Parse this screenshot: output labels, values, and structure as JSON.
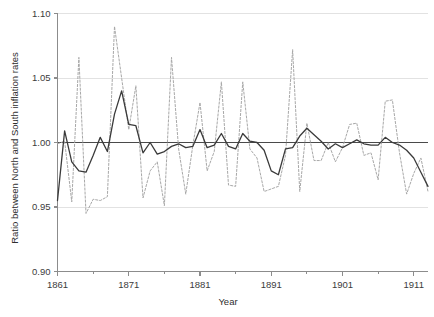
{
  "chart_data": {
    "type": "line",
    "title": "",
    "xlabel": "Year",
    "ylabel": "Ratio between North and South inflation rates",
    "xlim": [
      1861,
      1913
    ],
    "ylim": [
      0.9,
      1.1
    ],
    "grid": true,
    "grid_axis": "y",
    "legend": "none",
    "reference_line": 1.0,
    "xticks": [
      1861,
      1871,
      1881,
      1891,
      1901,
      1911
    ],
    "xticklabels": [
      "1861",
      "1871",
      "1881",
      "1891",
      "1901",
      "1911"
    ],
    "yticks": [
      0.9,
      0.95,
      1.0,
      1.05,
      1.1
    ],
    "yticklabels": [
      "0.90",
      "0.95",
      "1.00",
      "1.05",
      "1.10"
    ],
    "colors": {
      "smoothed": "#3a3a3a",
      "annual": "#a8a8a8",
      "reference": "#4a4a4a",
      "grid": "#e2e2e2",
      "axis": "#8c8c8c"
    },
    "series": [
      {
        "name": "annual ratio",
        "style": "dashed",
        "color": "#a8a8a8",
        "x": [
          1861,
          1862,
          1863,
          1864,
          1865,
          1866,
          1867,
          1868,
          1869,
          1870,
          1871,
          1872,
          1873,
          1874,
          1875,
          1876,
          1877,
          1878,
          1879,
          1880,
          1881,
          1882,
          1883,
          1884,
          1885,
          1886,
          1887,
          1888,
          1889,
          1890,
          1891,
          1892,
          1893,
          1894,
          1895,
          1896,
          1897,
          1898,
          1899,
          1900,
          1901,
          1902,
          1903,
          1904,
          1905,
          1906,
          1907,
          1908,
          1909,
          1910,
          1911,
          1912,
          1913
        ],
        "values": [
          0.999,
          1.001,
          0.954,
          1.066,
          0.945,
          0.956,
          0.955,
          0.958,
          1.09,
          1.05,
          1.01,
          1.044,
          0.957,
          0.978,
          0.985,
          0.951,
          1.066,
          0.995,
          0.96,
          0.998,
          1.031,
          0.978,
          0.993,
          1.047,
          0.967,
          0.966,
          1.047,
          0.995,
          0.988,
          0.962,
          0.964,
          0.966,
          0.99,
          1.072,
          0.962,
          1.015,
          0.986,
          0.986,
          1.0,
          0.985,
          0.996,
          1.014,
          1.015,
          0.99,
          0.992,
          0.971,
          1.032,
          1.033,
          0.992,
          0.96,
          0.976,
          0.988,
          0.962
        ]
      },
      {
        "name": "smoothed ratio",
        "style": "solid",
        "color": "#3a3a3a",
        "x": [
          1861,
          1862,
          1863,
          1864,
          1865,
          1866,
          1867,
          1868,
          1869,
          1870,
          1871,
          1872,
          1873,
          1874,
          1875,
          1876,
          1877,
          1878,
          1879,
          1880,
          1881,
          1882,
          1883,
          1884,
          1885,
          1886,
          1887,
          1888,
          1889,
          1890,
          1891,
          1892,
          1893,
          1894,
          1895,
          1896,
          1897,
          1898,
          1899,
          1900,
          1901,
          1902,
          1903,
          1904,
          1905,
          1906,
          1907,
          1908,
          1909,
          1910,
          1911,
          1912,
          1913
        ],
        "values": [
          0.955,
          1.009,
          0.985,
          0.978,
          0.977,
          0.99,
          1.004,
          0.993,
          1.022,
          1.04,
          1.014,
          1.013,
          0.992,
          1.0,
          0.991,
          0.993,
          0.997,
          0.999,
          0.996,
          0.997,
          1.01,
          0.996,
          0.998,
          1.007,
          0.997,
          0.995,
          1.007,
          1.001,
          1.0,
          0.994,
          0.978,
          0.975,
          0.995,
          0.996,
          1.005,
          1.011,
          1.006,
          1.001,
          0.995,
          0.999,
          0.996,
          0.999,
          1.002,
          0.999,
          0.998,
          0.998,
          1.004,
          1.0,
          0.998,
          0.994,
          0.988,
          0.977,
          0.966
        ]
      }
    ]
  },
  "axes": {
    "x_title": "Year",
    "y_title": "Ratio between North and South inflation rates"
  }
}
